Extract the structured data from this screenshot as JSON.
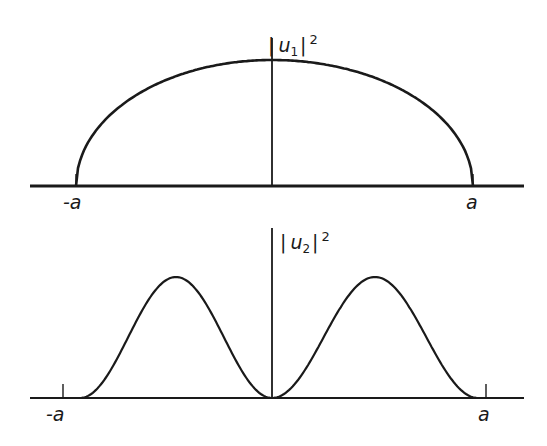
{
  "figure": {
    "top_panel": {
      "y_label": "|u1|²",
      "y_label_parts": {
        "open": "|",
        "var": "u",
        "sub": "1",
        "close": "|",
        "sup": "2"
      },
      "left_tick_label": "-a",
      "right_tick_label": "a",
      "curve": "semi-ellipse peaking at x=0, vanishing at ±a"
    },
    "bottom_panel": {
      "y_label": "|u2|²",
      "y_label_parts": {
        "open": "|",
        "var": "u",
        "sub": "2",
        "close": "|",
        "sup": "2"
      },
      "left_tick_label": "-a",
      "right_tick_label": "a",
      "curve": "double hump, zero at x=0 and at ±a, peaks near ±a/2"
    },
    "colors": {
      "ink": "#1a1a1a",
      "background": "#ffffff"
    }
  }
}
